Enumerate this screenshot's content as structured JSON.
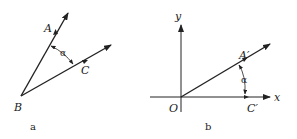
{
  "figures": [
    {
      "caption": "a",
      "points": {
        "A": "A",
        "B": "B",
        "C": "C"
      },
      "angle_label": "α"
    },
    {
      "caption": "b",
      "axes": {
        "x": "x",
        "y": "y",
        "origin": "O"
      },
      "points": {
        "A_prime": "A′",
        "C_prime": "C′"
      },
      "angle_label": "α"
    }
  ],
  "colors": {
    "stroke": "#222222"
  }
}
